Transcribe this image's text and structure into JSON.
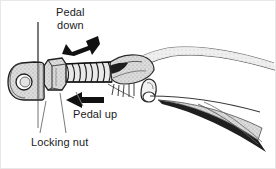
{
  "figure": {
    "kind": "technical-line-drawing",
    "background_color": "#ffffff",
    "ink_color": "#1b1b1b",
    "shade_color": "#c9c9c9",
    "light_shade_color": "#e0e0e0",
    "frame_color": "#e8e8e8"
  },
  "labels": {
    "pedal_down_line1": "Pedal",
    "pedal_down_line2": "down",
    "pedal_up": "Pedal up",
    "locking_nut": "Locking nut"
  },
  "arrows": [
    {
      "name": "pedal-down-arrow",
      "label": "Pedal down",
      "direction": "down-left",
      "angle_degrees": 205,
      "color": "#111111"
    },
    {
      "name": "pedal-up-arrow",
      "label": "Pedal up",
      "direction": "left",
      "angle_degrees": 180,
      "color": "#111111"
    }
  ],
  "parts": [
    {
      "name": "clevis-eye-end",
      "description": "rounded fork end with pin hole"
    },
    {
      "name": "pin-hole",
      "description": "circular hole in clevis"
    },
    {
      "name": "bracket-panel",
      "description": "thin vertical panel edge"
    },
    {
      "name": "locking-nut",
      "description": "hex jam nut on pushrod"
    },
    {
      "name": "threaded-rod",
      "description": "threaded pushrod section"
    },
    {
      "name": "pedal-arm",
      "description": "pedal lever arm tapering right"
    },
    {
      "name": "pedal-pivot-pin",
      "description": "pin head under pedal arm"
    }
  ],
  "leader_lines": [
    {
      "name": "leader-locking-nut-left",
      "from": [
        40,
        132
      ],
      "to": [
        46,
        100
      ]
    },
    {
      "name": "leader-locking-nut-right",
      "from": [
        66,
        132
      ],
      "to": [
        60,
        96
      ]
    },
    {
      "name": "leader-pedal-up",
      "from": [
        82,
        106
      ],
      "to": [
        74,
        92
      ]
    }
  ]
}
